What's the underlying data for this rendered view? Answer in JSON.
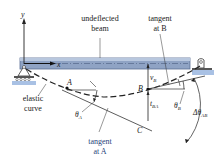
{
  "diagram": {
    "axes": {
      "y_label": "y",
      "x_label": "x"
    },
    "labels": {
      "undeflected_line1": "undeflected",
      "undeflected_line2": "beam",
      "tangent_b_line1": "tangent",
      "tangent_b_line2": "at B",
      "elastic_line1": "elastic",
      "elastic_line2": "curve",
      "tangent_a_line1": "tangent",
      "tangent_a_line2": "at A",
      "point_a": "A",
      "point_b": "B",
      "point_c": "C",
      "v_b": "v",
      "v_b_sub": "B",
      "t_ba": "t",
      "t_ba_sub": "BA",
      "theta_a": "θ",
      "theta_a_sub": "A",
      "theta_b": "θ",
      "theta_b_sub": "B",
      "delta_theta": "Δθ",
      "delta_theta_sub": "AB"
    },
    "colors": {
      "beam_fill": "#8fa3c4",
      "beam_edge": "#5a6e94",
      "support_base": "#a9c1e4",
      "line": "#222222",
      "tangent_a_text": "#1f3f7a"
    }
  }
}
